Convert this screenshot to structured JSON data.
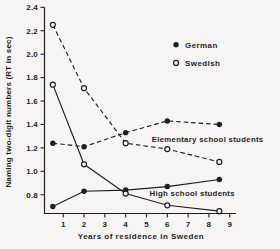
{
  "figure": {
    "background": "#f6f5f3",
    "ink": "#1f1f1f"
  },
  "chart_data": {
    "type": "line",
    "title": "",
    "xlabel": "Years of residence in Sweden",
    "ylabel": "Naming two-digit numbers (RT in sec)",
    "xlim": [
      0.1,
      9.3
    ],
    "ylim": [
      0.64,
      2.4
    ],
    "xticks": [
      1,
      2,
      3,
      4,
      5,
      6,
      7,
      8,
      9
    ],
    "yticks": [
      0.8,
      1.0,
      1.2,
      1.4,
      1.6,
      1.8,
      2.0,
      2.2,
      2.4
    ],
    "grid": false,
    "x": [
      0.5,
      2,
      4,
      6,
      8.5
    ],
    "series": [
      {
        "name": "Elementary school students - German",
        "group": "Elementary school students",
        "language": "German",
        "marker": "filled-circle",
        "line": "dashed",
        "values": [
          1.24,
          1.21,
          1.33,
          1.43,
          1.4
        ]
      },
      {
        "name": "Elementary school students - Swedish",
        "group": "Elementary school students",
        "language": "Swedish",
        "marker": "open-circle",
        "line": "dashed",
        "values": [
          2.25,
          1.71,
          1.24,
          1.19,
          1.08
        ]
      },
      {
        "name": "High school students - German",
        "group": "High school students",
        "language": "German",
        "marker": "filled-circle",
        "line": "solid",
        "values": [
          0.7,
          0.83,
          0.84,
          0.87,
          0.93
        ]
      },
      {
        "name": "High school students - Swedish",
        "group": "High school students",
        "language": "Swedish",
        "marker": "open-circle",
        "line": "solid",
        "values": [
          1.74,
          1.06,
          0.81,
          0.71,
          0.66
        ]
      }
    ],
    "legend": {
      "position": "upper-right",
      "entries": [
        {
          "label": "German",
          "marker": "filled-circle",
          "x": 6.42,
          "y": 2.08
        },
        {
          "label": "Swedish",
          "marker": "open-circle",
          "x": 6.42,
          "y": 1.925
        }
      ]
    },
    "annotations": [
      {
        "text": "Elementary school students",
        "x": 5.25,
        "y": 1.27
      },
      {
        "text": "High school students",
        "x": 5.15,
        "y": 0.81
      }
    ]
  }
}
